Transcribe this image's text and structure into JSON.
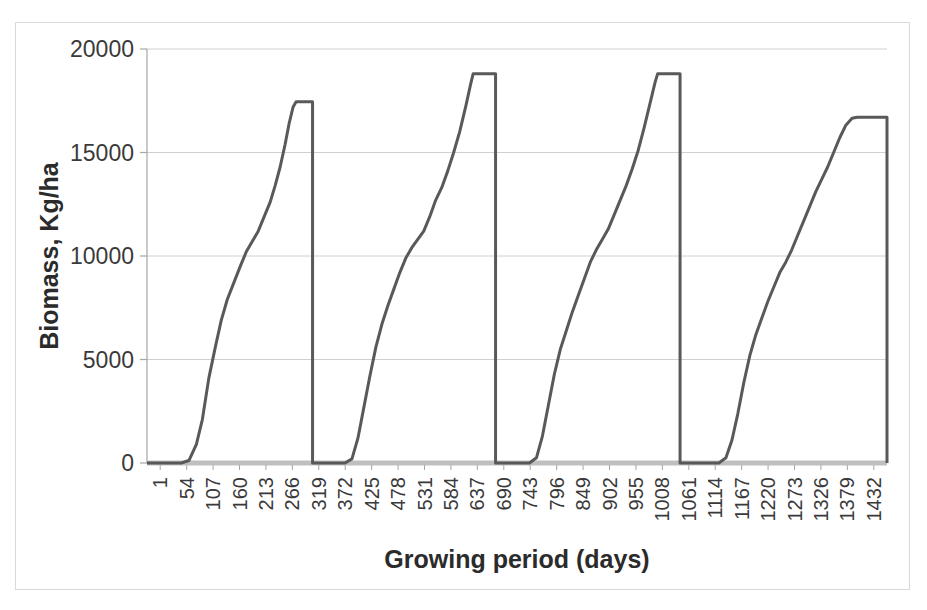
{
  "chart_data": {
    "type": "line",
    "title": "",
    "xlabel": "Growing period (days)",
    "ylabel": "Biomass, Kg/ha",
    "ylim": [
      0,
      20000
    ],
    "yticks": [
      0,
      5000,
      10000,
      15000,
      20000
    ],
    "ytick_labels": [
      "0",
      "5000",
      "10000",
      "15000",
      "20000"
    ],
    "grid": true,
    "legend": null,
    "xtick_labels": [
      "1",
      "54",
      "107",
      "160",
      "213",
      "266",
      "319",
      "372",
      "425",
      "478",
      "531",
      "584",
      "637",
      "690",
      "743",
      "796",
      "849",
      "902",
      "955",
      "1008",
      "1061",
      "1114",
      "1167",
      "1220",
      "1273",
      "1326",
      "1379",
      "1432"
    ],
    "x_axis_note": "Category axis: 28 displayed labels, step 53 days, data spans days 1..1485",
    "line_color": "#595959",
    "line_width": 3,
    "series": [
      {
        "name": "Biomass",
        "description": "Four successive sigmoid growth cycles, each ending in an abrupt harvest drop to zero.",
        "cycles": [
          {
            "cycle": 1,
            "start_day": 1,
            "lag_end_day": 78,
            "peak_day": 300,
            "peak_value": 17450,
            "harvest_day": 333,
            "points": [
              [
                1,
                0
              ],
              [
                40,
                0
              ],
              [
                70,
                0
              ],
              [
                85,
                120
              ],
              [
                100,
                900
              ],
              [
                112,
                2100
              ],
              [
                125,
                4100
              ],
              [
                138,
                5600
              ],
              [
                150,
                6900
              ],
              [
                162,
                7900
              ],
              [
                175,
                8700
              ],
              [
                188,
                9500
              ],
              [
                200,
                10200
              ],
              [
                212,
                10700
              ],
              [
                224,
                11200
              ],
              [
                236,
                11900
              ],
              [
                248,
                12600
              ],
              [
                258,
                13400
              ],
              [
                268,
                14300
              ],
              [
                278,
                15400
              ],
              [
                286,
                16400
              ],
              [
                294,
                17200
              ],
              [
                300,
                17450
              ],
              [
                318,
                17450
              ],
              [
                333,
                17450
              ],
              [
                333,
                0
              ]
            ]
          },
          {
            "cycle": 2,
            "start_day": 333,
            "lag_end_day": 400,
            "peak_day": 655,
            "peak_value": 18800,
            "harvest_day": 700,
            "points": [
              [
                333,
                0
              ],
              [
                370,
                0
              ],
              [
                398,
                0
              ],
              [
                412,
                200
              ],
              [
                424,
                1200
              ],
              [
                436,
                2700
              ],
              [
                448,
                4200
              ],
              [
                460,
                5600
              ],
              [
                472,
                6700
              ],
              [
                484,
                7600
              ],
              [
                496,
                8400
              ],
              [
                508,
                9200
              ],
              [
                520,
                9900
              ],
              [
                532,
                10400
              ],
              [
                544,
                10800
              ],
              [
                556,
                11200
              ],
              [
                568,
                11900
              ],
              [
                580,
                12700
              ],
              [
                592,
                13300
              ],
              [
                604,
                14100
              ],
              [
                616,
                15000
              ],
              [
                628,
                16000
              ],
              [
                640,
                17200
              ],
              [
                650,
                18300
              ],
              [
                655,
                18800
              ],
              [
                680,
                18800
              ],
              [
                700,
                18800
              ],
              [
                700,
                0
              ]
            ]
          },
          {
            "cycle": 3,
            "start_day": 700,
            "lag_end_day": 770,
            "peak_day": 1025,
            "peak_value": 18800,
            "harvest_day": 1070,
            "points": [
              [
                700,
                0
              ],
              [
                740,
                0
              ],
              [
                768,
                0
              ],
              [
                782,
                250
              ],
              [
                794,
                1300
              ],
              [
                806,
                2800
              ],
              [
                818,
                4300
              ],
              [
                830,
                5500
              ],
              [
                842,
                6400
              ],
              [
                854,
                7300
              ],
              [
                866,
                8100
              ],
              [
                878,
                8900
              ],
              [
                890,
                9700
              ],
              [
                902,
                10300
              ],
              [
                914,
                10800
              ],
              [
                926,
                11300
              ],
              [
                938,
                12000
              ],
              [
                950,
                12700
              ],
              [
                962,
                13400
              ],
              [
                974,
                14200
              ],
              [
                986,
                15100
              ],
              [
                998,
                16200
              ],
              [
                1010,
                17400
              ],
              [
                1020,
                18400
              ],
              [
                1025,
                18800
              ],
              [
                1048,
                18800
              ],
              [
                1070,
                18800
              ],
              [
                1070,
                0
              ]
            ]
          },
          {
            "cycle": 4,
            "start_day": 1070,
            "lag_end_day": 1150,
            "peak_day": 1425,
            "peak_value": 16700,
            "harvest_day": 1485,
            "points": [
              [
                1070,
                0
              ],
              [
                1110,
                0
              ],
              [
                1148,
                0
              ],
              [
                1162,
                250
              ],
              [
                1174,
                1100
              ],
              [
                1186,
                2400
              ],
              [
                1198,
                3900
              ],
              [
                1210,
                5200
              ],
              [
                1222,
                6200
              ],
              [
                1234,
                7000
              ],
              [
                1246,
                7800
              ],
              [
                1258,
                8500
              ],
              [
                1270,
                9200
              ],
              [
                1282,
                9700
              ],
              [
                1294,
                10300
              ],
              [
                1306,
                11000
              ],
              [
                1318,
                11700
              ],
              [
                1330,
                12400
              ],
              [
                1342,
                13100
              ],
              [
                1354,
                13700
              ],
              [
                1366,
                14300
              ],
              [
                1378,
                15000
              ],
              [
                1390,
                15700
              ],
              [
                1402,
                16300
              ],
              [
                1415,
                16650
              ],
              [
                1425,
                16700
              ],
              [
                1455,
                16700
              ],
              [
                1485,
                16700
              ],
              [
                1485,
                0
              ]
            ]
          }
        ]
      }
    ]
  },
  "styling": {
    "plot_bg": "#ffffff",
    "grid_color": "#d0d0d0",
    "axis_color": "#a6a6a6",
    "text_color": "#3a3a3a",
    "frame_color": "#d9d9d9"
  }
}
